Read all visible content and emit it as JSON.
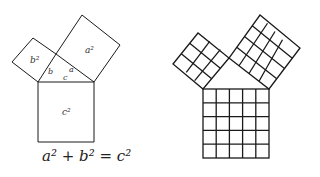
{
  "left_figure": {
    "labels": {
      "a_square": "a²",
      "b_square": "b²",
      "c_square": "c²",
      "side_a": "a",
      "side_b": "b",
      "side_c": "c"
    },
    "equation": "a² + b² = c²"
  },
  "right_figure": {
    "description": "Pythagorean theorem with grids",
    "grids": {
      "small_square": "3×3",
      "medium_square": "4×4",
      "large_square": "5×5"
    }
  },
  "colors": {
    "stroke": "#1a1a1a",
    "background": "#ffffff"
  }
}
